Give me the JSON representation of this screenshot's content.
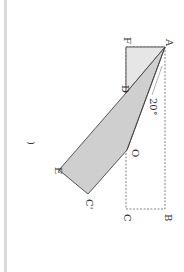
{
  "diagram": {
    "type": "folded-rectangle",
    "orientation": "rotated 90 degrees clockwise",
    "angle_label": "20°",
    "paren": ")",
    "points": {
      "A": {
        "label": "A",
        "x": 165,
        "y": 47
      },
      "F": {
        "label": "F",
        "x": 126,
        "y": 47
      },
      "D": {
        "label": "D",
        "x": 126,
        "y": 93
      },
      "O": {
        "label": "O",
        "x": 127,
        "y": 150
      },
      "C": {
        "label": "C",
        "x": 126,
        "y": 209
      },
      "B": {
        "label": "B",
        "x": 165,
        "y": 209
      },
      "E": {
        "label": "E",
        "x": 59,
        "y": 170
      },
      "G": {
        "label": "C'",
        "x": 88,
        "y": 194
      }
    },
    "colors": {
      "light_fill": "#e6e6e6",
      "dark_fill": "#cfcfcf",
      "stroke": "#444444",
      "dashed": "#666666"
    }
  }
}
